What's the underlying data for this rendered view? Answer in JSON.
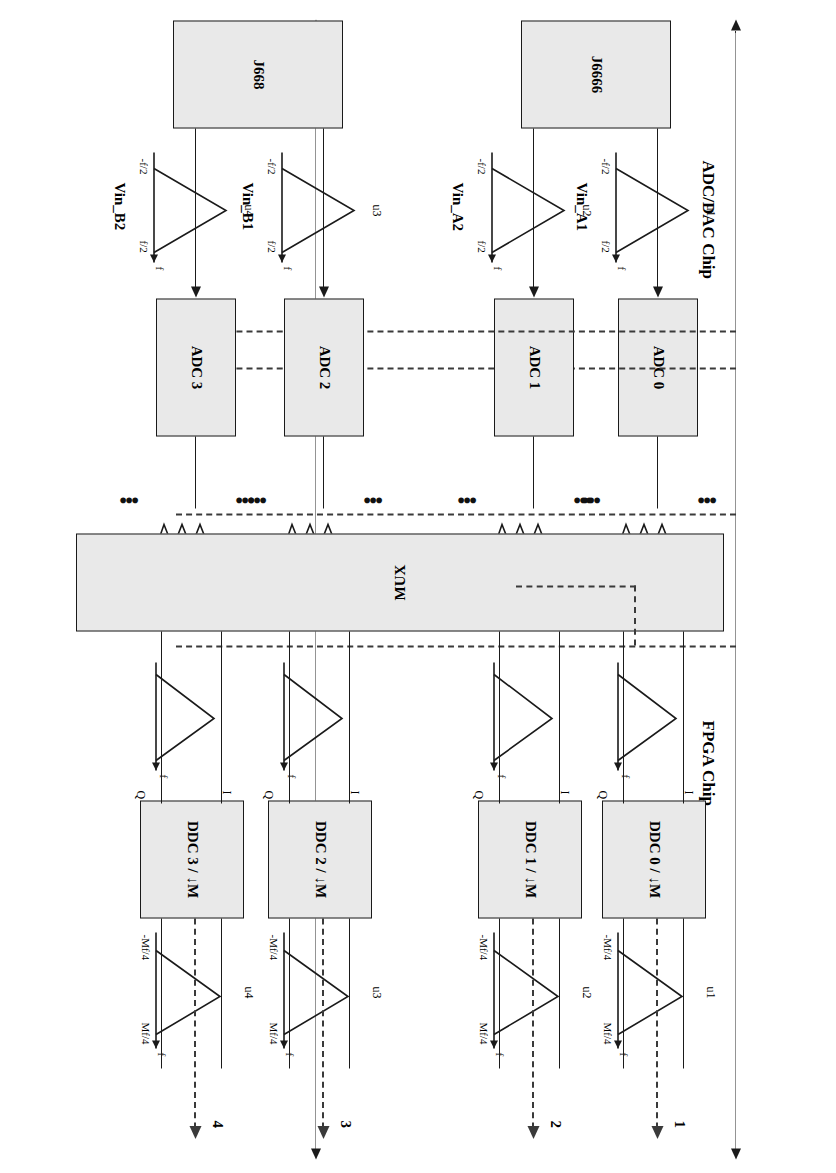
{
  "diagram": {
    "sections": [
      {
        "id": "adc_dac_chip",
        "label": "ADC/DAC Chip"
      },
      {
        "id": "fpga_chip",
        "label": "FPGA Chip"
      }
    ],
    "connectors": [
      {
        "id": "j6666",
        "label": "J6666"
      },
      {
        "id": "j668",
        "label": "J668"
      }
    ],
    "adc_blocks": [
      {
        "id": "adc0",
        "label": "ADC 0"
      },
      {
        "id": "adc1",
        "label": "ADC 1"
      },
      {
        "id": "adc2",
        "label": "ADC 2"
      },
      {
        "id": "adc3",
        "label": "ADC 3"
      }
    ],
    "mux": {
      "label": "MUX"
    },
    "ddc_blocks": [
      {
        "id": "ddc0",
        "label": "DDC 0 / ↓M"
      },
      {
        "id": "ddc1",
        "label": "DDC 1 / ↓M"
      },
      {
        "id": "ddc2",
        "label": "DDC 2 / ↓M"
      },
      {
        "id": "ddc3",
        "label": "DDC 3 / ↓M"
      }
    ],
    "inputs": [
      {
        "id": "vin_a1",
        "label": "Vin_A1",
        "source": "u1"
      },
      {
        "id": "vin_a2",
        "label": "Vin_A2",
        "source": "u2"
      },
      {
        "id": "vin_b1",
        "label": "Vin_B1",
        "source": "u3"
      },
      {
        "id": "vin_b2",
        "label": "Vin_B2",
        "source": "u4"
      }
    ],
    "outputs": [
      {
        "id": "out1",
        "label": "1",
        "source": "u1"
      },
      {
        "id": "out2",
        "label": "2",
        "source": "u2"
      },
      {
        "id": "out3",
        "label": "3",
        "source": "u3"
      },
      {
        "id": "out4",
        "label": "4",
        "source": "u4"
      }
    ],
    "iq_labels": [
      {
        "i": "I",
        "q": "Q"
      },
      {
        "i": "I",
        "q": "Q"
      },
      {
        "i": "I",
        "q": "Q"
      },
      {
        "i": "I",
        "q": "Q"
      }
    ],
    "input_spectra": {
      "axis_label": "f",
      "tick_low": "-f/2",
      "tick_high": "f/2",
      "sources": [
        "u1",
        "u2",
        "u3",
        "u4"
      ]
    },
    "adc_output_spectra": {
      "axis_label": "f",
      "replica_marks": "•••"
    },
    "ddc_input_spectra": {
      "axis_label": "f"
    },
    "output_spectra": {
      "axis_label": "f",
      "tick_low": "-Mf/4",
      "tick_high": "Mf/4",
      "sources": [
        "u1",
        "u2",
        "u3",
        "u4"
      ]
    }
  },
  "colors": {
    "block_fill": "#e9e9e9",
    "stroke": "#1a1a1a",
    "dashed_bus": "#3a3a3a"
  }
}
